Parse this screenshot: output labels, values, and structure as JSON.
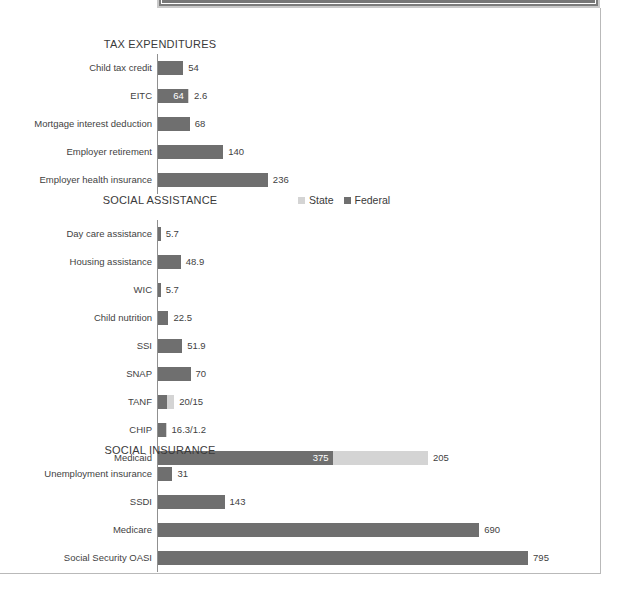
{
  "document": {
    "top_panel_present": true
  },
  "legend": {
    "items": [
      {
        "label": "State",
        "color": "#d4d4d4",
        "key": "state"
      },
      {
        "label": "Federal",
        "color": "#6f6f6f",
        "key": "federal"
      }
    ]
  },
  "colors": {
    "federal": "#6f6f6f",
    "state": "#d4d4d4",
    "axis": "#909090",
    "text": "#3f3f3f",
    "title": "#3a3a3a"
  },
  "chart_data": {
    "type": "bar",
    "orientation": "horizontal",
    "title": "",
    "xlabel": "",
    "ylabel": "",
    "grid": false,
    "legend_position": "top-right (Social Assistance panel)",
    "series": [
      {
        "name": "Federal",
        "color": "#6f6f6f"
      },
      {
        "name": "State",
        "color": "#d4d4d4"
      }
    ],
    "panels": [
      {
        "title": "TAX EXPENDITURES",
        "has_legend": false,
        "categories": [
          "Child tax credit",
          "EITC",
          "Mortgage interest deduction",
          "Employer retirement",
          "Employer health insurance"
        ],
        "rows": [
          {
            "label": "Child tax credit",
            "federal": 54,
            "state": null,
            "inside_label": null,
            "value_label": "54"
          },
          {
            "label": "EITC",
            "federal": 64,
            "state": 2.6,
            "inside_label": "64",
            "value_label": "2.6"
          },
          {
            "label": "Mortgage interest deduction",
            "federal": 68,
            "state": null,
            "inside_label": null,
            "value_label": "68"
          },
          {
            "label": "Employer retirement",
            "federal": 140,
            "state": null,
            "inside_label": null,
            "value_label": "140"
          },
          {
            "label": "Employer health insurance",
            "federal": 236,
            "state": null,
            "inside_label": null,
            "value_label": "236"
          }
        ]
      },
      {
        "title": "SOCIAL ASSISTANCE",
        "has_legend": true,
        "categories": [
          "Day care assistance",
          "Housing assistance",
          "WIC",
          "Child nutrition",
          "SSI",
          "SNAP",
          "TANF",
          "CHIP",
          "Medicaid"
        ],
        "rows": [
          {
            "label": "Day care assistance",
            "federal": 5.7,
            "state": null,
            "inside_label": null,
            "value_label": "5.7"
          },
          {
            "label": "Housing assistance",
            "federal": 48.9,
            "state": null,
            "inside_label": null,
            "value_label": "48.9"
          },
          {
            "label": "WIC",
            "federal": 5.7,
            "state": null,
            "inside_label": null,
            "value_label": "5.7"
          },
          {
            "label": "Child nutrition",
            "federal": 22.5,
            "state": null,
            "inside_label": null,
            "value_label": "22.5"
          },
          {
            "label": "SSI",
            "federal": 51.9,
            "state": null,
            "inside_label": null,
            "value_label": "51.9"
          },
          {
            "label": "SNAP",
            "federal": 70,
            "state": null,
            "inside_label": null,
            "value_label": "70"
          },
          {
            "label": "TANF",
            "federal": 20,
            "state": 15,
            "inside_label": null,
            "value_label": "20/15"
          },
          {
            "label": "CHIP",
            "federal": 16.3,
            "state": 1.2,
            "inside_label": null,
            "value_label": "16.3/1.2"
          },
          {
            "label": "Medicaid",
            "federal": 375,
            "state": 205,
            "inside_label": "375",
            "value_label": "205"
          }
        ]
      },
      {
        "title": "SOCIAL INSURANCE",
        "has_legend": false,
        "categories": [
          "Unemployment insurance",
          "SSDI",
          "Medicare",
          "Social Security OASI"
        ],
        "rows": [
          {
            "label": "Unemployment insurance",
            "federal": 31,
            "state": null,
            "inside_label": null,
            "value_label": "31"
          },
          {
            "label": "SSDI",
            "federal": 143,
            "state": null,
            "inside_label": null,
            "value_label": "143"
          },
          {
            "label": "Medicare",
            "federal": 690,
            "state": null,
            "inside_label": null,
            "value_label": "690"
          },
          {
            "label": "Social Security OASI",
            "federal": 795,
            "state": null,
            "inside_label": null,
            "value_label": "795"
          }
        ]
      }
    ]
  },
  "layout": {
    "axis_x": 157,
    "scale_px_per_unit": 0.4655,
    "panel_tops": [
      30,
      186,
      436
    ],
    "row_height": 28,
    "plot_offsets": [
      16,
      26,
      16
    ]
  }
}
